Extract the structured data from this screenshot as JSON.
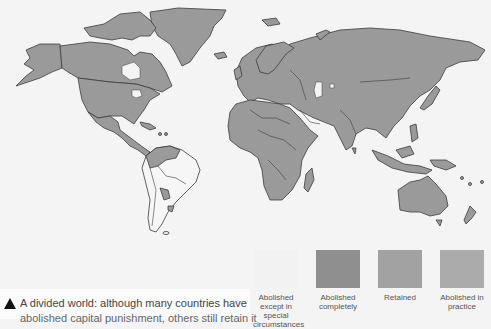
{
  "figure": {
    "caption_line1": "A divided world: although many countries have",
    "caption_line2": "abolished capital punishment, others still retain it",
    "caption_marker": "triangle-icon"
  },
  "legend": {
    "items": [
      {
        "label": "Abolished except in special circumstances",
        "color": "#f2f2f2"
      },
      {
        "label": "Abolished completely",
        "color": "#8f8f8f"
      },
      {
        "label": "Retained",
        "color": "#a2a2a2"
      },
      {
        "label": "Abolished in practice",
        "color": "#ababab"
      }
    ]
  },
  "map": {
    "title": "World map of capital punishment status",
    "land_color": "#9a9a9a",
    "ocean_color": "#f4f4f4",
    "border_color": "#3c3c3c",
    "white_regions": [
      "South America (most)",
      "Great Lakes",
      "Hudson Bay",
      "Caspian Sea"
    ]
  }
}
